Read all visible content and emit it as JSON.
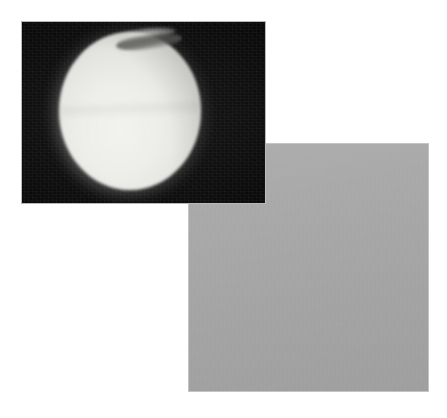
{
  "figure": {
    "background_color": "#ffffff",
    "width": 447,
    "height": 418,
    "caption": "",
    "panel_count": 2
  },
  "panels": [
    {
      "id": "full-disk",
      "label": "",
      "subject": "planetary-disk",
      "description": "Full illuminated disk of a hazy moon against black sky, with a dark detached haze streak over the north polar region",
      "frame_color": "#b9b9b9",
      "space_color": "#070707",
      "disk_color": "#ededea",
      "limb_color": "#9e9e99",
      "polar_streak_color": "#5a5a58",
      "x": 21,
      "y": 21,
      "width": 245,
      "height": 183
    },
    {
      "id": "limb-closeup",
      "label": "",
      "subject": "limb-closeup",
      "description": "High resolution close-up of the curved limb: bright hazy atmosphere filling the lower right, black space in the upper left, with a thin brighter detached haze rim along the edge",
      "frame_color": "#c4c4c4",
      "space_color": "#050505",
      "atmosphere_color": "#a9a9a9",
      "haze_rim_color": "#c0c0bf",
      "x": 188,
      "y": 143,
      "width": 241,
      "height": 249
    }
  ]
}
